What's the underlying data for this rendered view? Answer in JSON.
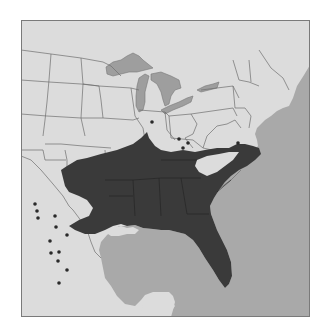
{
  "map": {
    "title": "Range map — southeastern United States",
    "colors": {
      "land": "#dcdcdc",
      "water": "#a9a9a9",
      "range": "#3a3a3a",
      "borders": "#6e6e6e",
      "frame": "#7a7a7a",
      "dots": "#2a2a2a"
    },
    "legend": {
      "range_label": "Continuous range",
      "dot_label": "Isolated occurrence"
    },
    "occurrence_points": [
      [
        14,
        184
      ],
      [
        16,
        191
      ],
      [
        17,
        198
      ],
      [
        34,
        196
      ],
      [
        35,
        207
      ],
      [
        46,
        215
      ],
      [
        29,
        221
      ],
      [
        30,
        233
      ],
      [
        38,
        232
      ],
      [
        37,
        241
      ],
      [
        46,
        250
      ],
      [
        38,
        263
      ],
      [
        131,
        102
      ],
      [
        158,
        119
      ],
      [
        167,
        123
      ],
      [
        162,
        128
      ],
      [
        217,
        123
      ]
    ]
  }
}
